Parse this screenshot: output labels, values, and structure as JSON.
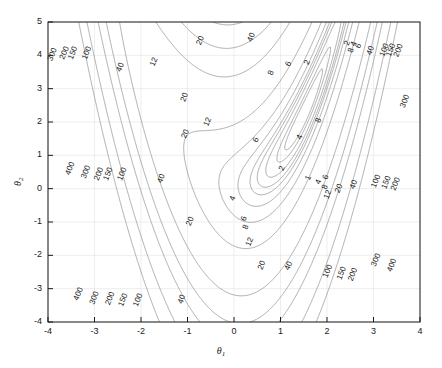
{
  "figure": {
    "background": "#ffffff",
    "axes_color": "#1a1a1a",
    "contour_color": "#808080",
    "grid_color": "#e0e0e0"
  },
  "axis": {
    "x_title": "θ",
    "x_title_sub": "1",
    "y_title": "θ",
    "y_title_sub": "2",
    "x_ticks": [
      "-4",
      "-3",
      "-2",
      "-1",
      "0",
      "1",
      "2",
      "3",
      "4"
    ],
    "y_ticks": [
      "5",
      "4",
      "3",
      "2",
      "1",
      "0",
      "-1",
      "-2",
      "-3",
      "-4"
    ]
  },
  "chart_data": {
    "type": "line",
    "subtype": "contour",
    "title": "",
    "xlabel": "θ₁",
    "ylabel": "θ₂",
    "xlim": [
      -4,
      4
    ],
    "ylim": [
      -4,
      5
    ],
    "xticks": [
      -4,
      -3,
      -2,
      -1,
      0,
      1,
      2,
      3,
      4
    ],
    "yticks": [
      -4,
      -3,
      -2,
      -1,
      0,
      1,
      2,
      3,
      4,
      5
    ],
    "grid": true,
    "legend": "none",
    "levels": [
      1,
      2,
      4,
      6,
      8,
      12,
      20,
      40,
      100,
      150,
      200,
      300,
      400
    ],
    "level_labels": [
      "1",
      "2",
      "4",
      "6",
      "8",
      "12",
      "20",
      "40",
      "100",
      "150",
      "200",
      "300",
      "400"
    ],
    "function": "rosenbrock-like banana valley",
    "minimum": {
      "x": 1.5,
      "y": 2.2,
      "value": 0
    },
    "inline_labels": [
      {
        "text": "300",
        "x": -3.86,
        "y": 4.0
      },
      {
        "text": "200",
        "x": -3.6,
        "y": 4.05
      },
      {
        "text": "150",
        "x": -3.42,
        "y": 4.05
      },
      {
        "text": "100",
        "x": -3.12,
        "y": 4.05
      },
      {
        "text": "40",
        "x": -2.4,
        "y": 3.62
      },
      {
        "text": "20",
        "x": -0.68,
        "y": 4.42
      },
      {
        "text": "12",
        "x": -1.68,
        "y": 3.78
      },
      {
        "text": "40",
        "x": 0.42,
        "y": 4.52
      },
      {
        "text": "20",
        "x": -1.02,
        "y": 2.72
      },
      {
        "text": "8",
        "x": 0.84,
        "y": 3.45
      },
      {
        "text": "6",
        "x": 1.22,
        "y": 3.72
      },
      {
        "text": "2",
        "x": 1.62,
        "y": 3.76
      },
      {
        "text": "2",
        "x": 2.48,
        "y": 4.34
      },
      {
        "text": "4",
        "x": 2.62,
        "y": 4.32
      },
      {
        "text": "6",
        "x": 2.72,
        "y": 4.26
      },
      {
        "text": "8",
        "x": 2.56,
        "y": 4.12
      },
      {
        "text": "40",
        "x": 2.98,
        "y": 4.12
      },
      {
        "text": "150",
        "x": 3.42,
        "y": 4.14
      },
      {
        "text": "100",
        "x": 3.28,
        "y": 4.14
      },
      {
        "text": "200",
        "x": 3.58,
        "y": 4.12
      },
      {
        "text": "8",
        "x": 1.86,
        "y": 2.02
      },
      {
        "text": "12",
        "x": -0.52,
        "y": 1.98
      },
      {
        "text": "20",
        "x": -1.0,
        "y": 1.62
      },
      {
        "text": "6",
        "x": 0.52,
        "y": 1.44
      },
      {
        "text": "4",
        "x": 1.46,
        "y": 1.52
      },
      {
        "text": "300",
        "x": 3.72,
        "y": 2.6
      },
      {
        "text": "2",
        "x": 1.08,
        "y": 0.58
      },
      {
        "text": "1",
        "x": 1.64,
        "y": 0.3
      },
      {
        "text": "4",
        "x": 1.86,
        "y": 0.18
      },
      {
        "text": "6",
        "x": 2.02,
        "y": 0.32
      },
      {
        "text": "8",
        "x": 2.0,
        "y": 0.02
      },
      {
        "text": "12",
        "x": 2.06,
        "y": -0.2
      },
      {
        "text": "20",
        "x": 2.3,
        "y": -0.02
      },
      {
        "text": "40",
        "x": 2.62,
        "y": 0.1
      },
      {
        "text": "100",
        "x": 3.1,
        "y": 0.2
      },
      {
        "text": "150",
        "x": 3.32,
        "y": 0.16
      },
      {
        "text": "200",
        "x": 3.52,
        "y": 0.12
      },
      {
        "text": "400",
        "x": -3.48,
        "y": 0.58
      },
      {
        "text": "300",
        "x": -3.14,
        "y": 0.48
      },
      {
        "text": "200",
        "x": -2.86,
        "y": 0.42
      },
      {
        "text": "150",
        "x": -2.66,
        "y": 0.42
      },
      {
        "text": "100",
        "x": -2.36,
        "y": 0.42
      },
      {
        "text": "40",
        "x": -1.52,
        "y": 0.28
      },
      {
        "text": "6",
        "x": 0.26,
        "y": -0.92
      },
      {
        "text": "8",
        "x": 0.3,
        "y": -1.18
      },
      {
        "text": "12",
        "x": 0.38,
        "y": -1.62
      },
      {
        "text": "4",
        "x": 0.02,
        "y": -0.32
      },
      {
        "text": "20",
        "x": -0.9,
        "y": -1.0
      },
      {
        "text": "20",
        "x": 0.64,
        "y": -2.32
      },
      {
        "text": "40",
        "x": 1.22,
        "y": -2.34
      },
      {
        "text": "400",
        "x": -3.3,
        "y": -3.18
      },
      {
        "text": "300",
        "x": -2.96,
        "y": -3.3
      },
      {
        "text": "200",
        "x": -2.62,
        "y": -3.32
      },
      {
        "text": "150",
        "x": -2.34,
        "y": -3.36
      },
      {
        "text": "100",
        "x": -2.02,
        "y": -3.36
      },
      {
        "text": "40",
        "x": -1.08,
        "y": -3.34
      },
      {
        "text": "100",
        "x": 2.06,
        "y": -2.5
      },
      {
        "text": "150",
        "x": 2.36,
        "y": -2.56
      },
      {
        "text": "200",
        "x": 2.6,
        "y": -2.6
      },
      {
        "text": "300",
        "x": 3.1,
        "y": -2.16
      },
      {
        "text": "400",
        "x": 3.44,
        "y": -2.32
      }
    ]
  }
}
